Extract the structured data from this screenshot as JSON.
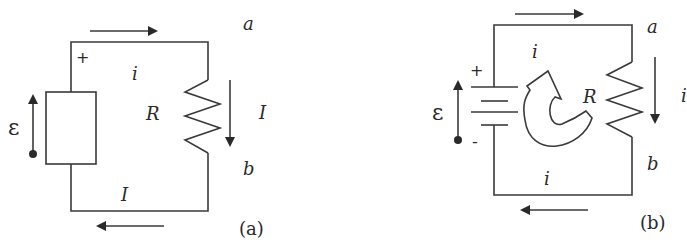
{
  "figure_a": {
    "caption": "(a)",
    "emf_label": "ε",
    "plus_label": "+",
    "node_a": "a",
    "node_b": "b",
    "resistor_label": "R",
    "loop_current_label": "i",
    "branch_current_label": "I",
    "bottom_current_label": "I",
    "source_type": "generic-box"
  },
  "figure_b": {
    "caption": "(b)",
    "emf_label": "ε",
    "plus_label": "+",
    "minus_label": "-",
    "node_a": "a",
    "node_b": "b",
    "resistor_label": "R",
    "loop_current_label_top": "i",
    "loop_current_label_bottom": "i",
    "branch_current_label": "i",
    "source_type": "battery"
  }
}
